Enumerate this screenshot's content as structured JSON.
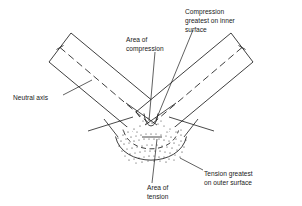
{
  "figure": {
    "background_color": "#ffffff",
    "line_color": "#1c1c1c",
    "text_color": "#1a1a1a"
  },
  "labels": {
    "neutral_axis": "Neutral axis",
    "area_of_compression_line1": "Area of",
    "area_of_compression_line2": "compression",
    "compression_greatest_line1": "Compression",
    "compression_greatest_line2": "greatest on inner",
    "compression_greatest_line3": "surface",
    "area_of_tension_line1": "Area of",
    "area_of_tension_line2": "tension",
    "tension_greatest_line1": "Tension greatest",
    "tension_greatest_line2": "on outer surface"
  },
  "parts": {
    "left_arm": "left-beam-arm",
    "right_arm": "right-beam-arm",
    "bend": "curved-bend-section",
    "compression_zone": "inner-compression-band",
    "tension_zone": "outer-tension-band",
    "neutral_axis_line": "neutral-axis-centerline"
  }
}
